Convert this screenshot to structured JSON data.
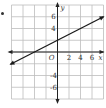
{
  "problem": {
    "bullet": "•"
  },
  "chart_data": {
    "type": "line",
    "title": "",
    "xlabel": "x",
    "ylabel": "y",
    "origin_label": "O",
    "xlim": [
      -8,
      8
    ],
    "ylim": [
      -8,
      8
    ],
    "grid": true,
    "grid_step": 2,
    "x_tick_labels": [
      "2",
      "4",
      "6"
    ],
    "y_tick_labels": [
      "6",
      "4",
      "-4",
      "-6"
    ],
    "series": [
      {
        "name": "line",
        "equation": "y = 0.5x + 2",
        "slope": 0.5,
        "intercept": 2,
        "x": [
          -8,
          8
        ],
        "y": [
          -2,
          6
        ],
        "arrows": "both"
      }
    ],
    "colors": {
      "grid": "#bdbdbd",
      "axis": "#222222",
      "line": "#1a1a1a"
    }
  }
}
